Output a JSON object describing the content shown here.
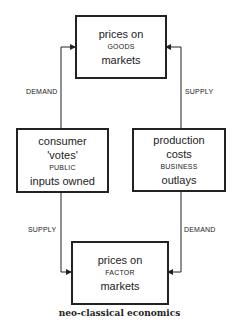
{
  "diagram": {
    "caption": "neo-classical economics",
    "boxes": {
      "goods": {
        "line1": "prices on",
        "line2": "GOODS",
        "line3": "markets"
      },
      "public": {
        "line1": "consumer",
        "line2": "'votes'",
        "line3": "PUBLIC",
        "line4": "inputs owned"
      },
      "business": {
        "line1": "production",
        "line2": "costs",
        "line3": "BUSINESS",
        "line4": "outlays"
      },
      "factor": {
        "line1": "prices on",
        "line2": "FACTOR",
        "line3": "markets"
      }
    },
    "edges": {
      "public_to_goods": "DEMAND",
      "business_to_goods": "SUPPLY",
      "public_to_factor": "SUPPLY",
      "business_to_factor": "DEMAND"
    }
  }
}
